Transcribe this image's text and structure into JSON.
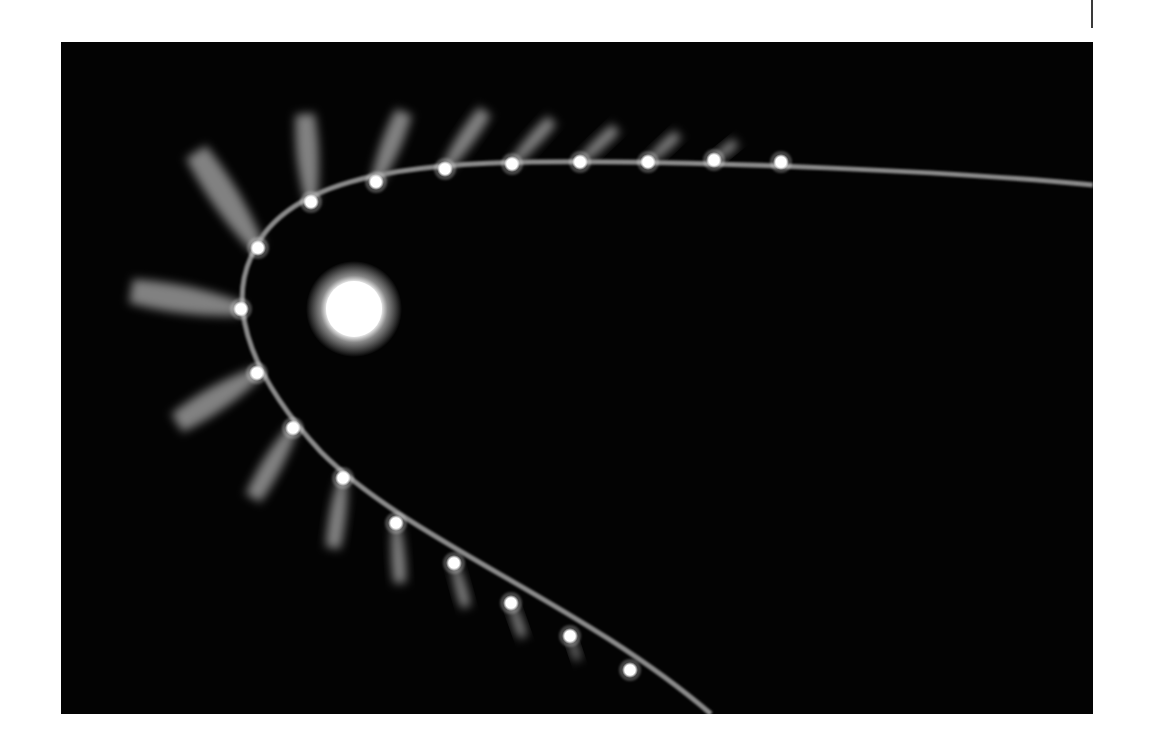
{
  "figure": {
    "background_color": "#030303",
    "sun": {
      "cx": 293,
      "cy": 267,
      "r": 28,
      "glow_r": 48,
      "color": "#ffffff"
    },
    "orbit": {
      "color": "#8a8a8a",
      "path": "M 1032 143 C 900 130, 640 118, 470 120 C 330 122, 220 140, 190 215 C 165 270, 195 340, 260 410 C 350 500, 520 560, 650 672"
    },
    "comets": [
      {
        "x": 720,
        "y": 120,
        "tail_dx": 0,
        "tail_dy": 0,
        "tail_w": 0
      },
      {
        "x": 653,
        "y": 118,
        "tail_dx": 22,
        "tail_dy": -18,
        "tail_w": 7
      },
      {
        "x": 587,
        "y": 120,
        "tail_dx": 30,
        "tail_dy": -28,
        "tail_w": 8
      },
      {
        "x": 519,
        "y": 120,
        "tail_dx": 36,
        "tail_dy": -34,
        "tail_w": 9
      },
      {
        "x": 451,
        "y": 122,
        "tail_dx": 40,
        "tail_dy": -44,
        "tail_w": 10
      },
      {
        "x": 384,
        "y": 127,
        "tail_dx": 40,
        "tail_dy": -58,
        "tail_w": 12
      },
      {
        "x": 315,
        "y": 140,
        "tail_dx": 28,
        "tail_dy": -70,
        "tail_w": 14
      },
      {
        "x": 250,
        "y": 160,
        "tail_dx": -6,
        "tail_dy": -88,
        "tail_w": 16
      },
      {
        "x": 197,
        "y": 206,
        "tail_dx": -62,
        "tail_dy": -96,
        "tail_w": 20
      },
      {
        "x": 180,
        "y": 267,
        "tail_dx": -110,
        "tail_dy": -18,
        "tail_w": 20
      },
      {
        "x": 196,
        "y": 331,
        "tail_dx": -80,
        "tail_dy": 50,
        "tail_w": 18
      },
      {
        "x": 232,
        "y": 386,
        "tail_dx": -40,
        "tail_dy": 70,
        "tail_w": 14
      },
      {
        "x": 282,
        "y": 436,
        "tail_dx": -10,
        "tail_dy": 70,
        "tail_w": 12
      },
      {
        "x": 335,
        "y": 481,
        "tail_dx": 4,
        "tail_dy": 60,
        "tail_w": 10
      },
      {
        "x": 393,
        "y": 521,
        "tail_dx": 12,
        "tail_dy": 44,
        "tail_w": 8
      },
      {
        "x": 450,
        "y": 561,
        "tail_dx": 12,
        "tail_dy": 34,
        "tail_w": 7
      },
      {
        "x": 509,
        "y": 594,
        "tail_dx": 8,
        "tail_dy": 24,
        "tail_w": 5
      },
      {
        "x": 569,
        "y": 628,
        "tail_dx": 0,
        "tail_dy": 0,
        "tail_w": 0
      }
    ]
  }
}
